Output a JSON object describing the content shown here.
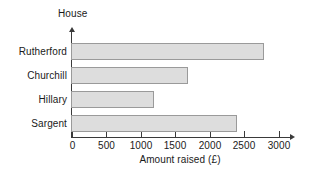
{
  "chart_data": {
    "type": "bar",
    "orientation": "horizontal",
    "title": "",
    "categories": [
      "Rutherford",
      "Churchill",
      "Hillary",
      "Sargent"
    ],
    "values": [
      2800,
      1700,
      1200,
      2400
    ],
    "xlabel": "Amount raised (£)",
    "ylabel": "House",
    "xlim": [
      0,
      3000
    ],
    "xticks": [
      0,
      500,
      1000,
      1500,
      2000,
      2500,
      3000
    ],
    "xtick_labels": [
      "0",
      "500",
      "1000",
      "1500",
      "2000",
      "2500",
      "3000"
    ],
    "grid": false,
    "legend": false,
    "bar_fill_color": "#dddddd",
    "bar_border_color": "#9a9a9a",
    "axis_color": "#3a3a3a",
    "background_color": "#ffffff"
  }
}
